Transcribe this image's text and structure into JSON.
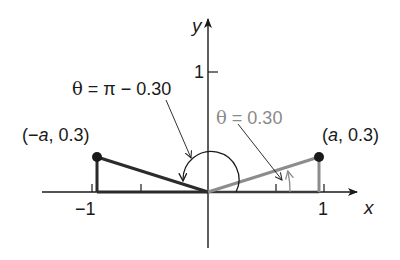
{
  "diagram": {
    "type": "unit-axes-angle-diagram",
    "axes": {
      "x_label": "x",
      "y_label": "y",
      "x_ticks": [
        {
          "value": -1,
          "label": "−1"
        },
        {
          "value": -0.5,
          "label": ""
        },
        {
          "value": 0.5,
          "label": ""
        },
        {
          "value": 1,
          "label": "1"
        }
      ],
      "y_ticks": [
        {
          "value": 1,
          "label": "1"
        }
      ]
    },
    "points": [
      {
        "id": "left-point",
        "label_prefix": "(−",
        "label_var": "a",
        "label_suffix": ", 0.3)",
        "x": "-a",
        "y": 0.3,
        "color": "#2a2a2a"
      },
      {
        "id": "right-point",
        "label_prefix": "(",
        "label_var": "a",
        "label_suffix": ", 0.3)",
        "x": "a",
        "y": 0.3,
        "color": "#2a2a2a"
      }
    ],
    "angles": [
      {
        "id": "angle-obtuse",
        "theta": "θ",
        "label_rest": " = π − 0.30",
        "value": "π − 0.30",
        "color": "#1a1a1a"
      },
      {
        "id": "angle-acute",
        "theta": "θ",
        "label_rest": " = 0.30",
        "value": "0.30",
        "color": "#8a8a8a"
      }
    ],
    "colors": {
      "axis": "#1a1a1a",
      "dark_segment": "#2b2b2b",
      "gray_segment": "#8c8c8c",
      "background": "#ffffff"
    }
  }
}
